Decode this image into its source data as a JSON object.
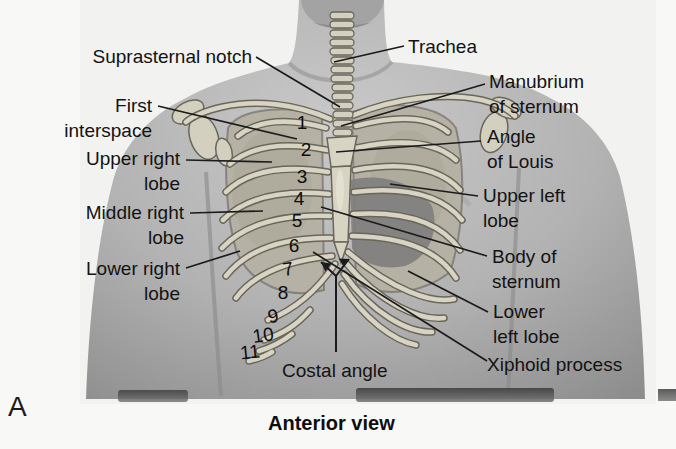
{
  "panel": {
    "letter": "A",
    "caption": "Anterior view"
  },
  "anatomy_labels": {
    "suprasternal_notch": "Suprasternal notch",
    "first_interspace": "First\ninterspace",
    "upper_right_lobe": "Upper right\nlobe",
    "middle_right_lobe": "Middle right\nlobe",
    "lower_right_lobe": "Lower right\nlobe",
    "trachea": "Trachea",
    "manubrium_of_sternum": "Manubrium\nof sternum",
    "angle_of_louis": "Angle\nof Louis",
    "upper_left_lobe": "Upper left\nlobe",
    "body_of_sternum": "Body of\nsternum",
    "lower_left_lobe": "Lower\nleft lobe",
    "xiphoid_process": "Xiphoid process",
    "costal_angle": "Costal angle"
  },
  "rib_numbers": [
    "1",
    "2",
    "3",
    "4",
    "5",
    "6",
    "7",
    "8",
    "9",
    "10",
    "11"
  ],
  "illustration": {
    "subject": "anterior-thorax-rib-cage-over-male-torso-photo",
    "skin_tone_hex": "#b2b2b2",
    "bone_hex": "#d8d4c4",
    "lung_hex": "#b5b1a4",
    "heart_shadow_hex": "#7e7e7e",
    "text_hex": "#131313"
  }
}
